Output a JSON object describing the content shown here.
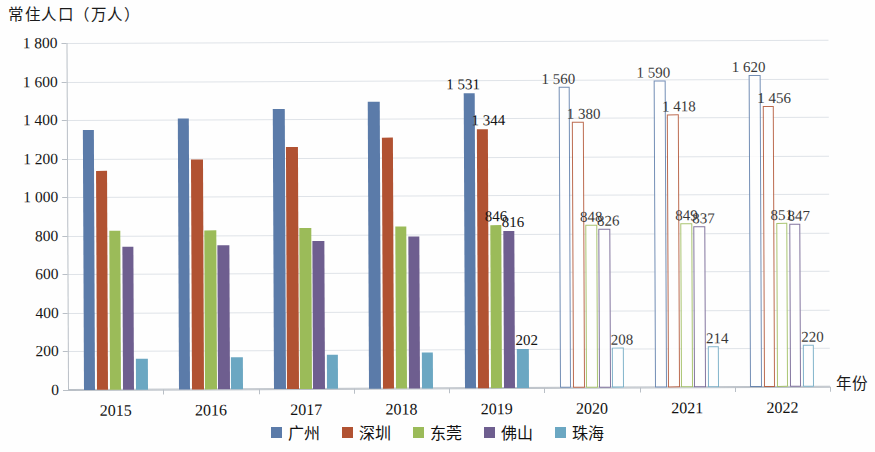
{
  "axes": {
    "y_title": "常住人口（万人）",
    "x_title": "年份",
    "y_ticks": [
      "0",
      "200",
      "400",
      "600",
      "800",
      "1 000",
      "1 200",
      "1 400",
      "1 600",
      "1 800"
    ],
    "x_ticks": [
      "2015",
      "2016",
      "2017",
      "2018",
      "2019",
      "2020",
      "2021",
      "2022"
    ]
  },
  "legend": {
    "items": [
      {
        "label": "广州",
        "color": "#5b7ba9"
      },
      {
        "label": "深圳",
        "color": "#b15232"
      },
      {
        "label": "东莞",
        "color": "#9bbb59"
      },
      {
        "label": "佛山",
        "color": "#6e5e8f"
      },
      {
        "label": "珠海",
        "color": "#6ba7c2"
      }
    ]
  },
  "chart_data": {
    "type": "bar",
    "title": "常住人口（万人）",
    "xlabel": "年份",
    "ylabel": "常住人口（万人）",
    "ylim": [
      0,
      1800
    ],
    "ytick_step": 200,
    "grid": true,
    "legend_position": "bottom",
    "categories": [
      "2015",
      "2016",
      "2017",
      "2018",
      "2019",
      "2020",
      "2021",
      "2022"
    ],
    "projected_categories": [
      "2020",
      "2021",
      "2022"
    ],
    "note": "实心柱为实际值（2015—2019），空心柱为预测值（2020—2022），仅预测年份与 2019 年标注数值",
    "series": [
      {
        "name": "广州",
        "color": "#5b7ba9",
        "values": [
          1350,
          1404,
          1450,
          1491,
          1531,
          1560,
          1590,
          1620
        ],
        "labels": [
          "",
          "",
          "",
          "",
          "1 531",
          "1 560",
          "1 590",
          "1 620"
        ]
      },
      {
        "name": "深圳",
        "color": "#b15232",
        "values": [
          1138,
          1191,
          1253,
          1303,
          1344,
          1380,
          1418,
          1456
        ],
        "labels": [
          "",
          "",
          "",
          "",
          "1 344",
          "1 380",
          "1 418",
          "1 456"
        ]
      },
      {
        "name": "东莞",
        "color": "#9bbb59",
        "values": [
          825,
          826,
          834,
          839,
          846,
          848,
          849,
          851
        ],
        "labels": [
          "",
          "",
          "",
          "",
          "846",
          "848",
          "849",
          "851"
        ]
      },
      {
        "name": "佛山",
        "color": "#6e5e8f",
        "values": [
          743,
          746,
          766,
          791,
          816,
          826,
          837,
          847
        ],
        "labels": [
          "",
          "",
          "",
          "",
          "816",
          "826",
          "837",
          "847"
        ]
      },
      {
        "name": "珠海",
        "color": "#6ba7c2",
        "values": [
          163,
          167,
          177,
          189,
          202,
          208,
          214,
          220
        ],
        "labels": [
          "",
          "",
          "",
          "",
          "202",
          "208",
          "214",
          "220"
        ]
      }
    ]
  }
}
